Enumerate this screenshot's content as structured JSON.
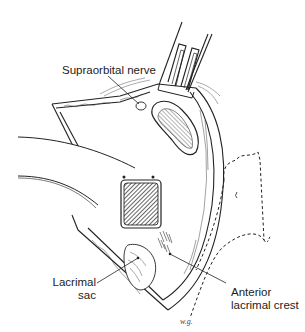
{
  "figure": {
    "type": "surgical line illustration",
    "labels": {
      "supraorbital_nerve": "Supraorbital nerve",
      "lacrimal_sac_line1": "Lacrimal",
      "lacrimal_sac_line2": "sac",
      "anterior_crest_line1": "Anterior",
      "anterior_crest_line2": "lacrimal crest"
    },
    "signature": "w.g."
  },
  "colors": {
    "ink": "#222222",
    "background": "#ffffff",
    "hatch": "#333333"
  }
}
